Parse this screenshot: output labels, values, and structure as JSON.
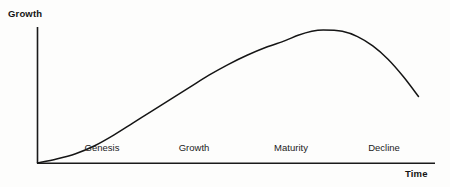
{
  "chart_data": {
    "type": "line",
    "title": "",
    "xlabel": "Time",
    "ylabel": "Growth",
    "grid": false,
    "legend": false,
    "axis_style": "open-l-shape",
    "annotations": [
      {
        "label": "Genesis",
        "x_center": 102
      },
      {
        "label": "Growth",
        "x_center": 194
      },
      {
        "label": "Maturity",
        "x_center": 291
      },
      {
        "label": "Decline",
        "x_center": 384
      }
    ],
    "series": [
      {
        "name": "Growth",
        "color": "#151515",
        "points": [
          {
            "x": 0,
            "y": 0
          },
          {
            "x": 0.05,
            "y": 0.03
          },
          {
            "x": 0.1,
            "y": 0.07
          },
          {
            "x": 0.15,
            "y": 0.13
          },
          {
            "x": 0.2,
            "y": 0.21
          },
          {
            "x": 0.25,
            "y": 0.3
          },
          {
            "x": 0.3,
            "y": 0.39
          },
          {
            "x": 0.35,
            "y": 0.48
          },
          {
            "x": 0.4,
            "y": 0.57
          },
          {
            "x": 0.45,
            "y": 0.66
          },
          {
            "x": 0.5,
            "y": 0.74
          },
          {
            "x": 0.55,
            "y": 0.81
          },
          {
            "x": 0.6,
            "y": 0.87
          },
          {
            "x": 0.65,
            "y": 0.92
          },
          {
            "x": 0.684,
            "y": 0.96
          },
          {
            "x": 0.72,
            "y": 0.99
          },
          {
            "x": 0.75,
            "y": 1.0
          },
          {
            "x": 0.8,
            "y": 0.99
          },
          {
            "x": 0.84,
            "y": 0.95
          },
          {
            "x": 0.88,
            "y": 0.88
          },
          {
            "x": 0.92,
            "y": 0.78
          },
          {
            "x": 0.96,
            "y": 0.65
          },
          {
            "x": 1.0,
            "y": 0.5
          }
        ]
      }
    ],
    "xlim": [
      0,
      1
    ],
    "ylim": [
      0,
      1
    ],
    "xtick_labels": [],
    "ytick_labels": []
  },
  "axes": {
    "y_title": "Growth",
    "x_title": "Time"
  },
  "phases": [
    {
      "label": "Genesis"
    },
    {
      "label": "Growth"
    },
    {
      "label": "Maturity"
    },
    {
      "label": "Decline"
    }
  ],
  "colors": {
    "ink": "#151515",
    "axis": "#1a1a1a",
    "background": "#fdfdfc"
  }
}
